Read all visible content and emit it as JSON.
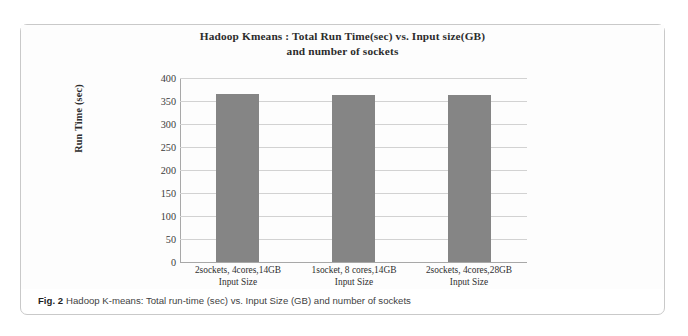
{
  "figure": {
    "caption_tag": "Fig. 2",
    "caption_text": "Hadoop K-means: Total run-time (sec) vs. Input Size (GB) and number of sockets"
  },
  "colors": {
    "bar_fill": "#858585",
    "gridline": "#d2d2d2",
    "axis": "#a8a8a8",
    "frame": "#c9c9c9",
    "title_text": "#2c2c2c"
  },
  "chart_data": {
    "type": "bar",
    "title": "Hadoop Kmeans : Total Run Time(sec) vs. Input size(GB) and number of sockets",
    "title_lines": [
      "Hadoop Kmeans : Total Run Time(sec) vs. Input size(GB)",
      "and number of sockets"
    ],
    "categories": [
      "2sockets, 4cores,14GB",
      "1socket, 8 cores,14GB",
      "2sockets, 4cores,28GB"
    ],
    "category_sublabels": [
      "Input Size",
      "Input Size",
      "Input Size"
    ],
    "values": [
      365,
      362,
      364
    ],
    "xlabel": "Input Size",
    "ylabel": "Run Time (sec)",
    "ylim": [
      0,
      400
    ],
    "yticks": [
      0,
      50,
      100,
      150,
      200,
      250,
      300,
      350,
      400
    ],
    "ytick_labels": [
      "0",
      "50",
      "100",
      "150",
      "200",
      "250",
      "300",
      "350",
      "400"
    ],
    "grid": true,
    "legend": false,
    "series": [
      {
        "name": "Total Run Time (sec)",
        "values": [
          365,
          362,
          364
        ]
      }
    ]
  }
}
